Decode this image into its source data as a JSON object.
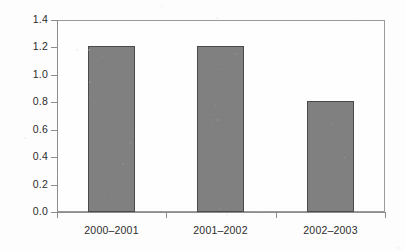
{
  "chart_data": {
    "type": "bar",
    "title": "",
    "subtitle": "",
    "xlabel": "",
    "ylabel": "",
    "categories": [
      "2000–2001",
      "2001–2002",
      "2002–2003"
    ],
    "values": [
      1.21,
      1.21,
      0.81
    ],
    "series": [
      {
        "name": "",
        "values": [
          1.21,
          1.21,
          0.81
        ]
      }
    ],
    "ylim": [
      0.0,
      1.4
    ],
    "ytick_labels": [
      "0.0",
      "0.2",
      "0.4",
      "0.6",
      "0.8",
      "1.0",
      "1.2",
      "1.4"
    ],
    "ytick_values": [
      0.0,
      0.2,
      0.4,
      0.6,
      0.8,
      1.0,
      1.2,
      1.4
    ],
    "grid": false,
    "legend": false,
    "legend_position": "none",
    "bar_color": "#808080",
    "bar_border_color": "#4a4a4a",
    "axis_color": "#8c8c8c",
    "frame_color": "#9a9a9a",
    "background_color": "#fdfdfd",
    "text_color": "#2b2b2b"
  }
}
